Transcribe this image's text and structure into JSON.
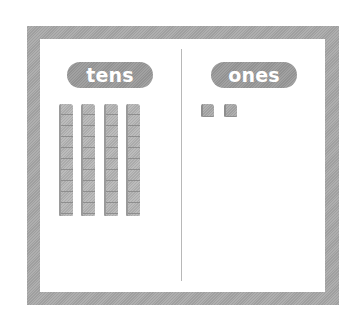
{
  "diagram": {
    "type": "place-value-chart",
    "columns": [
      {
        "label": "tens",
        "count": 4,
        "block": "ten-rod"
      },
      {
        "label": "ones",
        "count": 2,
        "block": "unit-cube"
      }
    ],
    "colors": {
      "frame": "#a8a8a8",
      "label_pill": "#9a9a9a",
      "label_text": "#ffffff",
      "blocks": "#b4b4b4",
      "divider": "#b8b8b8",
      "background": "#ffffff"
    }
  }
}
